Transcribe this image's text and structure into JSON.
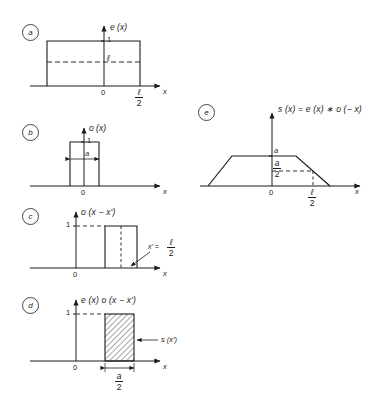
{
  "figure": {
    "background": "#ffffff",
    "ink": "#1a1a1a",
    "axis_color": "#1a1a1a",
    "panels": [
      {
        "tag": "a",
        "title": "e (x)",
        "y_top_label": "1",
        "dashed_level_label": "ℓ",
        "origin_label": "0",
        "x_axis_label": "x",
        "right_tick_label": "ℓ",
        "right_tick_den": "2"
      },
      {
        "tag": "b",
        "title": "o (x)",
        "y_top_label": "1",
        "width_label": "a",
        "origin_label": "0",
        "x_axis_label": "x"
      },
      {
        "tag": "c",
        "title": "o (x − x′)",
        "y_top_label": "1",
        "origin_label": "0",
        "x_axis_label": "x",
        "marker_label": "x′ =",
        "marker_num": "ℓ",
        "marker_den": "2"
      },
      {
        "tag": "d",
        "title": "e (x) o (x − x′)",
        "y_top_label": "1",
        "origin_label": "0",
        "x_axis_label": "x",
        "area_label": "s (x′)",
        "width_num": "a",
        "width_den": "2"
      },
      {
        "tag": "e",
        "title": "s (x) = e (x) ∗ o (− x)",
        "peak_label": "a",
        "half_num": "a",
        "half_den": "2",
        "origin_label": "0",
        "x_axis_label": "x",
        "right_tick_num": "ℓ",
        "right_tick_den": "2"
      }
    ]
  }
}
